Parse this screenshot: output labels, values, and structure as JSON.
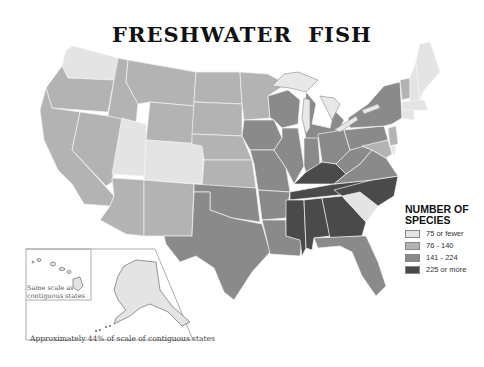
{
  "map": {
    "title": "FRESHWATER FISH",
    "subject": "Number of freshwater fish species by U.S. state",
    "legend": {
      "title_line1": "NUMBER OF",
      "title_line2": "SPECIES",
      "items": [
        {
          "label": "75 or fewer",
          "color": "#e4e4e4"
        },
        {
          "label": "76 - 140",
          "color": "#b3b3b3"
        },
        {
          "label": "141 - 224",
          "color": "#8a8a8a"
        },
        {
          "label": "225 or more",
          "color": "#4a4a4a"
        }
      ]
    },
    "insets": {
      "hawaii_label": "Same scale as contiguous states",
      "alaska_label": "Approximately 44% of scale of contiguous states"
    },
    "state_categories": {
      "75 or fewer": [
        "Washington",
        "Utah",
        "Colorado",
        "Maine",
        "New Hampshire",
        "Vermont",
        "Massachusetts",
        "Connecticut",
        "Rhode Island",
        "Delaware",
        "South Carolina",
        "Alaska",
        "Hawaii"
      ],
      "76 - 140": [
        "Oregon",
        "California",
        "Nevada",
        "Idaho",
        "Montana",
        "Wyoming",
        "Arizona",
        "New Mexico",
        "North Dakota",
        "South Dakota",
        "Nebraska",
        "Kansas",
        "Minnesota",
        "New Jersey",
        "Maryland"
      ],
      "141 - 224": [
        "Texas",
        "Oklahoma",
        "Iowa",
        "Missouri",
        "Arkansas",
        "Louisiana",
        "Wisconsin",
        "Illinois",
        "Michigan",
        "Indiana",
        "Ohio",
        "West Virginia",
        "Pennsylvania",
        "New York",
        "Virginia",
        "Florida"
      ],
      "225 or more": [
        "Kentucky",
        "Tennessee",
        "Mississippi",
        "Alabama",
        "Georgia",
        "North Carolina"
      ]
    }
  }
}
